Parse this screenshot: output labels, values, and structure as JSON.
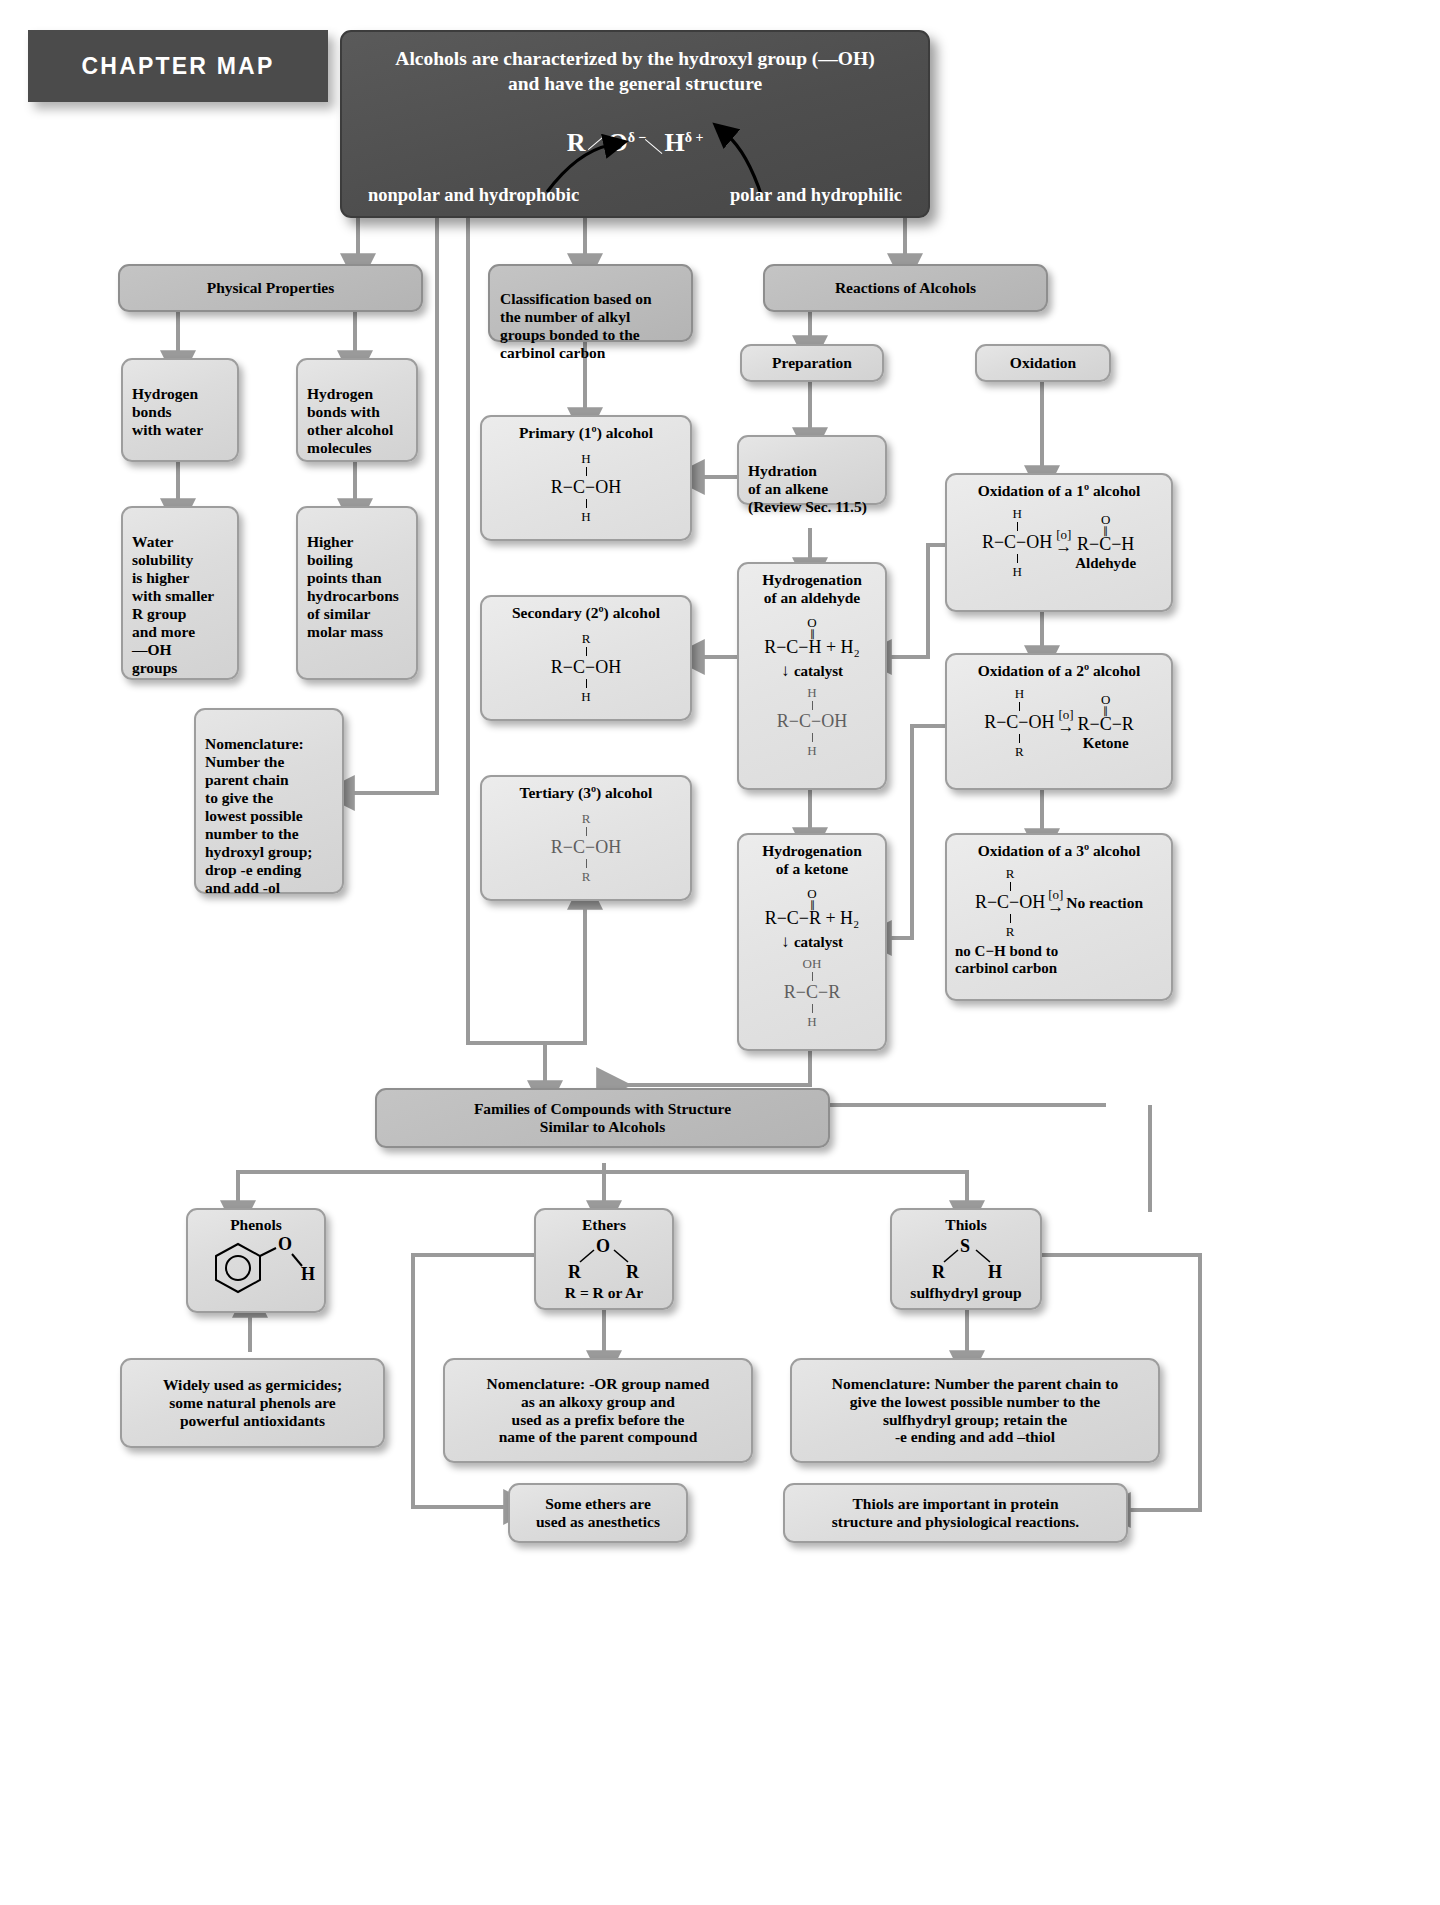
{
  "banner": {
    "label": "CHAPTER MAP"
  },
  "header": {
    "title_line1": "Alcohols are characterized by the hydroxyl group (—OH)",
    "title_line2": "and have the general structure",
    "structure": {
      "r": "R",
      "o": "O",
      "o_charge": "δ −",
      "h": "H",
      "h_charge": "δ +"
    },
    "left_note": "nonpolar and hydrophobic",
    "right_note": "polar and hydrophilic"
  },
  "branches": {
    "physical_properties": "Physical Properties",
    "classification": "Classification based on\nthe number of alkyl\ngroups bonded to the\ncarbinol carbon",
    "reactions": "Reactions of Alcohols"
  },
  "physical": {
    "hbond_water": "Hydrogen\nbonds\nwith water",
    "hbond_alcohol": "Hydrogen\nbonds with\nother alcohol\nmolecules",
    "solubility": "Water\nsolubility\nis higher\nwith smaller\nR group\nand more\n—OH\ngroups",
    "boiling": "Higher\nboiling\npoints than\nhydrocarbons\nof similar\nmolar mass",
    "nomenclature": "Nomenclature:\nNumber the\nparent chain\nto give the\nlowest possible\nnumber to the\nhydroxyl group;\ndrop -e ending\nand add -ol"
  },
  "classification": {
    "primary": {
      "title": "Primary (1º) alcohol",
      "top": "H",
      "bottom": "H",
      "left": "R",
      "right": "OH",
      "center": "C"
    },
    "secondary": {
      "title": "Secondary (2º) alcohol",
      "top": "R",
      "bottom": "H",
      "left": "R",
      "right": "OH",
      "center": "C"
    },
    "tertiary": {
      "title": "Tertiary (3º) alcohol",
      "top": "R",
      "bottom": "R",
      "left": "R",
      "right": "OH",
      "center": "C"
    }
  },
  "reactions": {
    "preparation": "Preparation",
    "oxidation": "Oxidation",
    "hydration": "Hydration\nof an alkene\n(Review Sec. 11.5)",
    "hydrogenation_aldehyde": {
      "title": "Hydrogenation\nof an aldehyde",
      "reactant": "R−C−H + H₂",
      "reactant_top": "O",
      "catalyst": "catalyst",
      "product_top": "H",
      "product": "R−C−OH",
      "product_bottom": "H"
    },
    "hydrogenation_ketone": {
      "title": "Hydrogenation\nof a ketone",
      "reactant": "R−C−R + H₂",
      "reactant_top": "O",
      "catalyst": "catalyst",
      "product_top": "OH",
      "product": "R−C−R",
      "product_bottom": "H"
    }
  },
  "oxidations": {
    "primary": {
      "title": "Oxidation of a 1º alcohol",
      "sub_top": "H",
      "sub_bottom": "H",
      "left": "R−C−OH",
      "agent": "[o]",
      "prod_top": "O",
      "product": "R−C−H",
      "product_name": "Aldehyde"
    },
    "secondary": {
      "title": "Oxidation of a 2º alcohol",
      "sub_top": "H",
      "sub_bottom": "R",
      "left": "R−C−OH",
      "agent": "[o]",
      "prod_top": "O",
      "product": "R−C−R",
      "product_name": "Ketone"
    },
    "tertiary": {
      "title": "Oxidation of a 3º alcohol",
      "sub_top": "R",
      "sub_bottom": "R",
      "left": "R−C−OH",
      "agent": "[o]",
      "product": "No reaction",
      "note": "no C−H bond to\ncarbinol carbon"
    }
  },
  "families": {
    "title": "Families of Compounds with Structure\nSimilar to Alcohols",
    "phenols": {
      "title": "Phenols",
      "atom_o": "O",
      "atom_h": "H"
    },
    "ethers": {
      "title": "Ethers",
      "atom_o": "O",
      "left_r": "R",
      "right_r": "R",
      "note": "R = R or Ar"
    },
    "thiols": {
      "title": "Thiols",
      "atom_s": "S",
      "left_r": "R",
      "right_h": "H",
      "note": "sulfhydryl group"
    }
  },
  "footers": {
    "phenols_use": "Widely used as germicides;\nsome natural phenols are\npowerful antioxidants",
    "ethers_nomenclature": "Nomenclature: -OR group named\nas an alkoxy group and\nused as a prefix before the\nname of the parent compound",
    "thiols_nomenclature": "Nomenclature: Number the parent chain to\ngive the lowest possible number to the\nsulfhydryl group; retain the\n-e ending and add –thiol",
    "ethers_anesthetics": "Some ethers are\nused as anesthetics",
    "thiols_protein": "Thiols are important in protein\nstructure and physiological reactions."
  },
  "colors": {
    "arrow": "#9a9a9a",
    "box_border": "#9d9d9d",
    "dark_box": "#4e4e4e"
  }
}
